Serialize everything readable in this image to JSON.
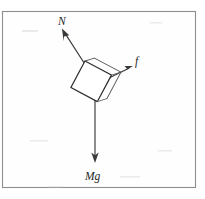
{
  "figure": {
    "kind": "free-body-diagram",
    "title": "",
    "background_color": "#ffffff",
    "frame": {
      "name": "figure-border",
      "x": 2.5,
      "y": 11.5,
      "width": 193,
      "height": 176,
      "stroke_color": "#8d8d8d"
    },
    "body": {
      "name": "block",
      "shape": "rotated-square-cube",
      "center_x": 92,
      "center_y": 84,
      "half_size": 17,
      "rotation_deg": 28,
      "stroke_color": "#2e2e2e",
      "fill_color": "#ffffff"
    },
    "forces": [
      {
        "id": "normal",
        "label": "N",
        "description": "normal force",
        "start_x": 88,
        "start_y": 69,
        "end_x": 63,
        "end_y": 30,
        "label_x": 58,
        "label_y": 25,
        "color": "#3a3a3a"
      },
      {
        "id": "friction",
        "label": "f",
        "description": "friction force",
        "start_x": 104,
        "start_y": 80,
        "end_x": 132,
        "end_y": 66,
        "label_x": 134,
        "label_y": 65,
        "color": "#3a3a3a"
      },
      {
        "id": "weight",
        "label": "Mg",
        "description": "weight",
        "start_x": 95,
        "start_y": 100,
        "end_x": 95,
        "end_y": 161,
        "label_x": 87,
        "label_y": 179,
        "color": "#3a3a3a"
      }
    ]
  }
}
